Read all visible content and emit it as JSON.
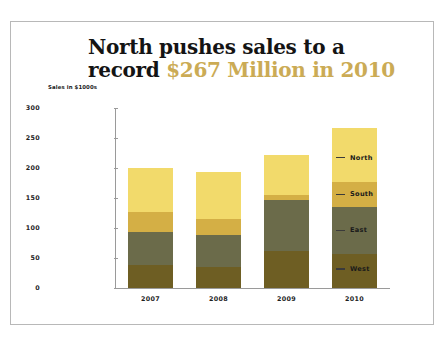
{
  "chart_data": {
    "type": "bar",
    "stacked": true,
    "title_line1": "North pushes sales to a",
    "title_line2_prefix": "record ",
    "title_line2_accent": "$267 Million in 2010",
    "ylabel": "Sales in $1000s",
    "xlabel": "",
    "categories": [
      "2007",
      "2008",
      "2009",
      "2010"
    ],
    "ylim": [
      0,
      300
    ],
    "yticks": [
      0,
      50,
      100,
      150,
      200,
      250,
      300
    ],
    "grid": false,
    "legend_position": "right",
    "series": [
      {
        "name": "West",
        "color": "#6e5e23",
        "values": [
          38,
          35,
          62,
          57
        ]
      },
      {
        "name": "East",
        "color": "#6b6b4a",
        "values": [
          55,
          53,
          85,
          78
        ]
      },
      {
        "name": "South",
        "color": "#d4af45",
        "values": [
          33,
          27,
          8,
          42
        ]
      },
      {
        "name": "North",
        "color": "#f2da6b",
        "values": [
          74,
          78,
          67,
          90
        ]
      }
    ],
    "totals": [
      200,
      193,
      222,
      267
    ],
    "legend_order": [
      "North",
      "South",
      "East",
      "West"
    ],
    "accent_color": "#cbab55"
  }
}
